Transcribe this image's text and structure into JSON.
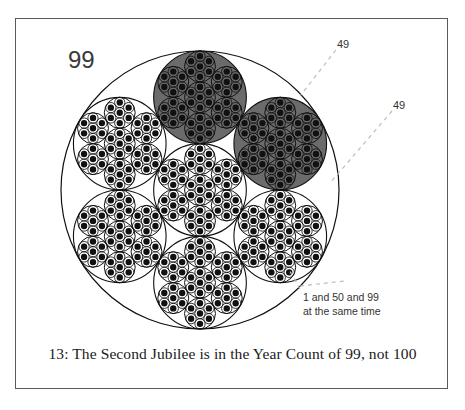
{
  "figure": {
    "caption": "13:  The Second Jubilee is in the Year Count of 99, not 100",
    "total_label": "99",
    "callouts": [
      {
        "name": "callout-49-upper",
        "text": "49"
      },
      {
        "name": "callout-49-lower",
        "text": "49"
      }
    ],
    "note": {
      "line1": "1 and 50 and 99",
      "line2": "at the same time"
    },
    "colors": {
      "stroke": "#111111",
      "highlight_fill": "#6b6b6b",
      "frame": "#555a5e",
      "background": "#ffffff",
      "leader": "#b9b9b9"
    },
    "geometry": {
      "outer_circle": {
        "cx": 200,
        "cy": 190,
        "r": 139
      },
      "cluster_count": 7,
      "nesting_levels": 4,
      "highlighted_indices": [
        1,
        2
      ]
    }
  },
  "chart_data": {
    "type": "diagram",
    "title": "13:  The Second Jubilee is in the Year Count of 99, not 100",
    "categories": [
      "total",
      "highlighted-upper",
      "highlighted-lower"
    ],
    "values": [
      99,
      49,
      49
    ],
    "annotations": [
      "99",
      "49",
      "49",
      "1 and 50 and 99",
      "at the same time"
    ]
  }
}
